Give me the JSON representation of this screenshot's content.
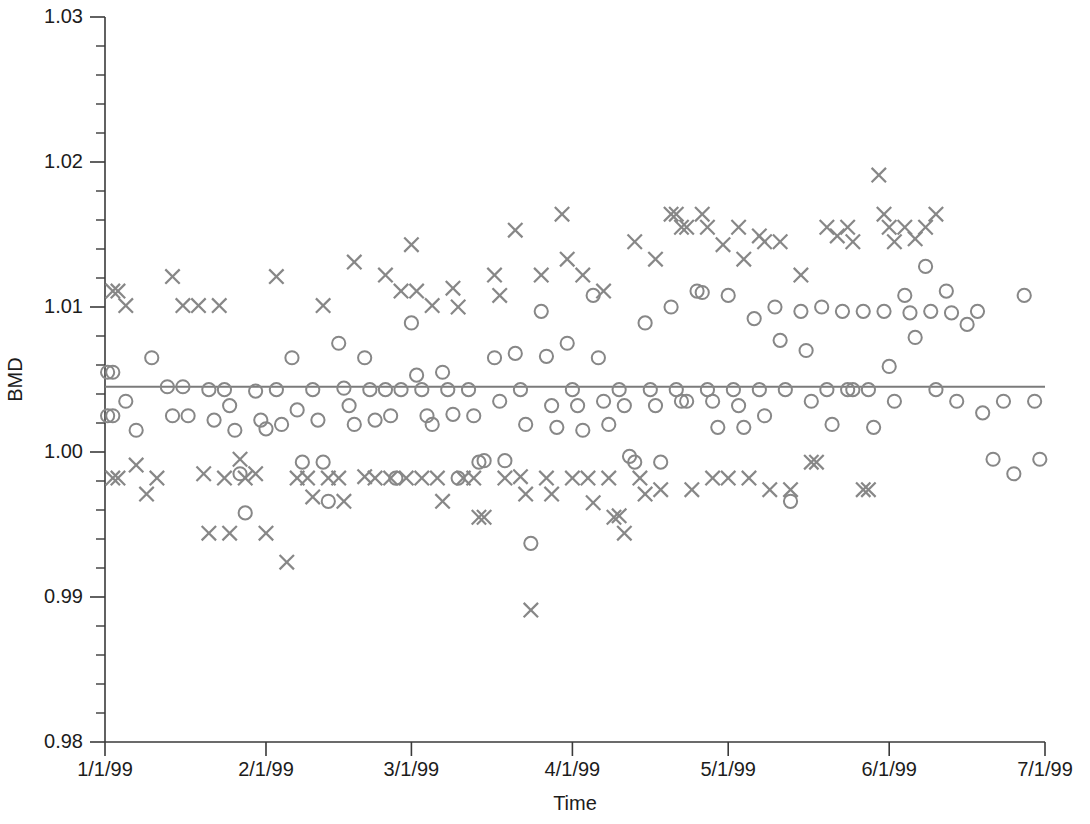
{
  "chart_data": {
    "type": "scatter",
    "title": "",
    "xlabel": "Time",
    "ylabel": "BMD",
    "grid": false,
    "legend": "none",
    "ylim": [
      0.98,
      1.03
    ],
    "xlim": [
      "1/1/99",
      "7/1/99"
    ],
    "y_ticks": [
      "0.98",
      "0.99",
      "1.00",
      "1.01",
      "1.02",
      "1.03"
    ],
    "y_tick_values": [
      0.98,
      0.99,
      1.0,
      1.01,
      1.02,
      1.03
    ],
    "y_minor_step": 0.002,
    "x_ticks": [
      "1/1/99",
      "2/1/99",
      "3/1/99",
      "4/1/99",
      "5/1/99",
      "6/1/99",
      "7/1/99"
    ],
    "x_tick_days": [
      0,
      31,
      59,
      90,
      120,
      151,
      181
    ],
    "reference_line": {
      "value": 1.0045,
      "label": "mean-reference-line",
      "color": "#7b7b7b"
    },
    "marker_color": "#878787",
    "series": [
      {
        "name": "circle-series",
        "marker": "circle",
        "points": [
          [
            0.5,
            1.0055
          ],
          [
            1.5,
            1.0055
          ],
          [
            0.5,
            1.0025
          ],
          [
            1.5,
            1.0025
          ],
          [
            4,
            1.0035
          ],
          [
            6,
            1.0015
          ],
          [
            9,
            1.0065
          ],
          [
            12,
            1.0045
          ],
          [
            13,
            1.0025
          ],
          [
            15,
            1.0045
          ],
          [
            16,
            1.0025
          ],
          [
            20,
            1.0043
          ],
          [
            21,
            1.0022
          ],
          [
            23,
            1.0043
          ],
          [
            24,
            1.0032
          ],
          [
            25,
            1.0015
          ],
          [
            26,
            0.9985
          ],
          [
            27,
            0.9958
          ],
          [
            29,
            1.0042
          ],
          [
            30,
            1.0022
          ],
          [
            31,
            1.0016
          ],
          [
            33,
            1.0043
          ],
          [
            34,
            1.0019
          ],
          [
            36,
            1.0065
          ],
          [
            37,
            1.0029
          ],
          [
            38,
            0.9993
          ],
          [
            40,
            1.0043
          ],
          [
            41,
            1.0022
          ],
          [
            42,
            0.9993
          ],
          [
            43,
            0.9966
          ],
          [
            45,
            1.0075
          ],
          [
            46,
            1.0044
          ],
          [
            47,
            1.0032
          ],
          [
            48,
            1.0019
          ],
          [
            50,
            1.0065
          ],
          [
            51,
            1.0043
          ],
          [
            52,
            1.0022
          ],
          [
            54,
            1.0043
          ],
          [
            55,
            1.0025
          ],
          [
            56,
            0.9982
          ],
          [
            57,
            1.0043
          ],
          [
            59,
            1.0089
          ],
          [
            60,
            1.0053
          ],
          [
            61,
            1.0043
          ],
          [
            62,
            1.0025
          ],
          [
            63,
            1.0019
          ],
          [
            65,
            1.0055
          ],
          [
            66,
            1.0043
          ],
          [
            67,
            1.0026
          ],
          [
            68,
            0.9982
          ],
          [
            70,
            1.0043
          ],
          [
            71,
            1.0025
          ],
          [
            72,
            0.9993
          ],
          [
            73,
            0.9994
          ],
          [
            75,
            1.0065
          ],
          [
            76,
            1.0035
          ],
          [
            77,
            0.9994
          ],
          [
            79,
            1.0068
          ],
          [
            80,
            1.0043
          ],
          [
            81,
            1.0019
          ],
          [
            82,
            0.9937
          ],
          [
            84,
            1.0097
          ],
          [
            85,
            1.0066
          ],
          [
            86,
            1.0032
          ],
          [
            87,
            1.0017
          ],
          [
            89,
            1.0075
          ],
          [
            90,
            1.0043
          ],
          [
            91,
            1.0032
          ],
          [
            92,
            1.0015
          ],
          [
            94,
            1.0108
          ],
          [
            95,
            1.0065
          ],
          [
            96,
            1.0035
          ],
          [
            97,
            1.0019
          ],
          [
            99,
            1.0043
          ],
          [
            100,
            1.0032
          ],
          [
            101,
            0.9997
          ],
          [
            102,
            0.9993
          ],
          [
            104,
            1.0089
          ],
          [
            105,
            1.0043
          ],
          [
            106,
            1.0032
          ],
          [
            107,
            0.9993
          ],
          [
            109,
            1.01
          ],
          [
            110,
            1.0043
          ],
          [
            111,
            1.0035
          ],
          [
            112,
            1.0035
          ],
          [
            114,
            1.0111
          ],
          [
            115,
            1.011
          ],
          [
            116,
            1.0043
          ],
          [
            117,
            1.0035
          ],
          [
            118,
            1.0017
          ],
          [
            120,
            1.0108
          ],
          [
            121,
            1.0043
          ],
          [
            122,
            1.0032
          ],
          [
            123,
            1.0017
          ],
          [
            125,
            1.0092
          ],
          [
            126,
            1.0043
          ],
          [
            127,
            1.0025
          ],
          [
            129,
            1.01
          ],
          [
            130,
            1.0077
          ],
          [
            131,
            1.0043
          ],
          [
            132,
            0.9966
          ],
          [
            134,
            1.0097
          ],
          [
            135,
            1.007
          ],
          [
            136,
            1.0035
          ],
          [
            138,
            1.01
          ],
          [
            139,
            1.0043
          ],
          [
            140,
            1.0019
          ],
          [
            142,
            1.0097
          ],
          [
            143,
            1.0043
          ],
          [
            144,
            1.0043
          ],
          [
            146,
            1.0097
          ],
          [
            147,
            1.0043
          ],
          [
            148,
            1.0017
          ],
          [
            150,
            1.0097
          ],
          [
            151,
            1.0059
          ],
          [
            152,
            1.0035
          ],
          [
            154,
            1.0108
          ],
          [
            155,
            1.0096
          ],
          [
            156,
            1.0079
          ],
          [
            158,
            1.0128
          ],
          [
            159,
            1.0097
          ],
          [
            160,
            1.0043
          ],
          [
            162,
            1.0111
          ],
          [
            163,
            1.0096
          ],
          [
            164,
            1.0035
          ],
          [
            166,
            1.0088
          ],
          [
            168,
            1.0097
          ],
          [
            169,
            1.0027
          ],
          [
            171,
            0.9995
          ],
          [
            173,
            1.0035
          ],
          [
            175,
            0.9985
          ],
          [
            177,
            1.0108
          ],
          [
            179,
            1.0035
          ],
          [
            180,
            0.9995
          ]
        ]
      },
      {
        "name": "x-series",
        "marker": "x",
        "points": [
          [
            1.5,
            1.0111
          ],
          [
            2.5,
            1.0111
          ],
          [
            1.5,
            0.9982
          ],
          [
            2.5,
            0.9982
          ],
          [
            4,
            1.0101
          ],
          [
            6,
            0.9991
          ],
          [
            8,
            0.9971
          ],
          [
            10,
            0.9982
          ],
          [
            13,
            1.0121
          ],
          [
            15,
            1.0101
          ],
          [
            18,
            1.0101
          ],
          [
            19,
            0.9985
          ],
          [
            20,
            0.9944
          ],
          [
            22,
            1.0101
          ],
          [
            23,
            0.9982
          ],
          [
            24,
            0.9944
          ],
          [
            26,
            0.9995
          ],
          [
            27,
            0.9982
          ],
          [
            29,
            0.9985
          ],
          [
            31,
            0.9944
          ],
          [
            33,
            1.0121
          ],
          [
            35,
            0.9924
          ],
          [
            37,
            0.9982
          ],
          [
            39,
            0.9982
          ],
          [
            40,
            0.9969
          ],
          [
            42,
            1.0101
          ],
          [
            43,
            0.9982
          ],
          [
            45,
            0.9982
          ],
          [
            46,
            0.9966
          ],
          [
            48,
            1.0131
          ],
          [
            50,
            0.9983
          ],
          [
            52,
            0.9982
          ],
          [
            54,
            1.0122
          ],
          [
            55,
            0.9982
          ],
          [
            57,
            1.0111
          ],
          [
            58,
            0.9982
          ],
          [
            59,
            1.0143
          ],
          [
            60,
            1.0111
          ],
          [
            61,
            0.9982
          ],
          [
            63,
            1.0101
          ],
          [
            64,
            0.9982
          ],
          [
            65,
            0.9966
          ],
          [
            67,
            1.0113
          ],
          [
            68,
            1.01
          ],
          [
            69,
            0.9982
          ],
          [
            71,
            0.9982
          ],
          [
            72,
            0.9955
          ],
          [
            73,
            0.9955
          ],
          [
            75,
            1.0122
          ],
          [
            76,
            1.0108
          ],
          [
            77,
            0.9982
          ],
          [
            79,
            1.0153
          ],
          [
            80,
            0.9983
          ],
          [
            81,
            0.9971
          ],
          [
            82,
            0.9891
          ],
          [
            84,
            1.0122
          ],
          [
            85,
            0.9982
          ],
          [
            86,
            0.9971
          ],
          [
            88,
            1.0164
          ],
          [
            89,
            1.0133
          ],
          [
            90,
            0.9982
          ],
          [
            92,
            1.0122
          ],
          [
            93,
            0.9982
          ],
          [
            94,
            0.9965
          ],
          [
            96,
            1.0111
          ],
          [
            97,
            0.9982
          ],
          [
            98,
            0.9955
          ],
          [
            99,
            0.9956
          ],
          [
            100,
            0.9944
          ],
          [
            102,
            1.0145
          ],
          [
            103,
            0.9982
          ],
          [
            104,
            0.9971
          ],
          [
            106,
            1.0133
          ],
          [
            107,
            0.9974
          ],
          [
            109,
            1.0164
          ],
          [
            110,
            1.0164
          ],
          [
            111,
            1.0155
          ],
          [
            112,
            1.0155
          ],
          [
            113,
            0.9974
          ],
          [
            115,
            1.0164
          ],
          [
            116,
            1.0155
          ],
          [
            117,
            0.9982
          ],
          [
            119,
            1.0143
          ],
          [
            120,
            0.9982
          ],
          [
            122,
            1.0155
          ],
          [
            123,
            1.0133
          ],
          [
            124,
            0.9982
          ],
          [
            126,
            1.0149
          ],
          [
            127,
            1.0145
          ],
          [
            128,
            0.9974
          ],
          [
            130,
            1.0145
          ],
          [
            132,
            0.9974
          ],
          [
            134,
            1.0122
          ],
          [
            136,
            0.9993
          ],
          [
            137,
            0.9993
          ],
          [
            139,
            1.0155
          ],
          [
            141,
            1.0149
          ],
          [
            143,
            1.0155
          ],
          [
            144,
            1.0145
          ],
          [
            146,
            0.9974
          ],
          [
            147,
            0.9974
          ],
          [
            149,
            1.0191
          ],
          [
            150,
            1.0164
          ],
          [
            151,
            1.0155
          ],
          [
            152,
            1.0145
          ],
          [
            154,
            1.0155
          ],
          [
            156,
            1.0147
          ],
          [
            158,
            1.0155
          ],
          [
            160,
            1.0164
          ]
        ]
      }
    ]
  },
  "layout": {
    "plot_left_px": 105,
    "plot_right_px": 1045,
    "plot_top_px": 17,
    "plot_bottom_px": 742
  }
}
